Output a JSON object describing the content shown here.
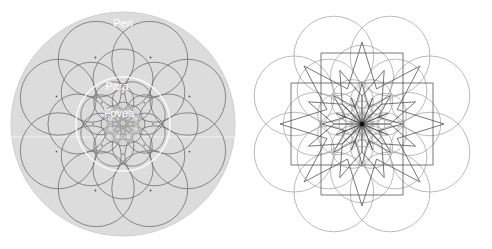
{
  "left_panel": {
    "labels": {
      "peri": "Peri",
      "para": "Para",
      "fovea": "Fovea"
    },
    "colors": {
      "disc": "#d9d9d9",
      "ring": "#ffffff",
      "stroke": "#6e6e6e",
      "label": "#ffffff"
    }
  },
  "right_panel": {
    "colors": {
      "circle": "#a8a8a8",
      "star": "#555555",
      "center": "#111111"
    }
  }
}
